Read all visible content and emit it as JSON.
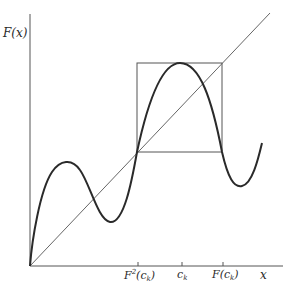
{
  "diagram": {
    "type": "cobweb-period-doubling",
    "y_axis_label": "F(x)",
    "x_axis_label": "x",
    "tick_labels": {
      "f2_ck": {
        "base": "F",
        "sup": "2",
        "open": "(c",
        "sub": "k",
        "close": ")"
      },
      "ck": {
        "base": "c",
        "sub": "k"
      },
      "f_ck": {
        "base": "F(c",
        "sub": "k",
        "close": ")"
      }
    },
    "elements": [
      "axes",
      "diagonal y = x",
      "curve F(x)",
      "square box from F²(c_k) to F(c_k)"
    ],
    "colors": {
      "curve": "#2a2a2a",
      "lines": "#555555",
      "text": "#2a2a2a"
    }
  }
}
